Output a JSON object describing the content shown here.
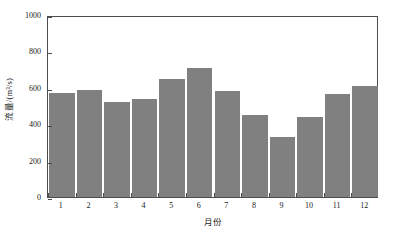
{
  "chart_data": {
    "type": "bar",
    "title": "",
    "subtitle": "",
    "xlabel": "月份",
    "ylabel": "流量/(m³/s)",
    "categories": [
      "1",
      "2",
      "3",
      "4",
      "5",
      "6",
      "7",
      "8",
      "9",
      "10",
      "11",
      "12"
    ],
    "values": [
      573,
      590,
      520,
      540,
      648,
      710,
      585,
      448,
      328,
      440,
      565,
      608
    ],
    "series": [
      {
        "name": "流量",
        "values": [
          573,
          590,
          520,
          540,
          648,
          710,
          585,
          448,
          328,
          440,
          565,
          608
        ]
      }
    ],
    "ylim": [
      0,
      1000
    ],
    "ytick_labels": [
      "0",
      "200",
      "400",
      "600",
      "800",
      "1000"
    ],
    "ytick_values": [
      0,
      200,
      400,
      600,
      800,
      1000
    ],
    "xtick_labels": [
      "1",
      "2",
      "3",
      "4",
      "5",
      "6",
      "7",
      "8",
      "9",
      "10",
      "11",
      "12"
    ],
    "grid": false,
    "legend": false,
    "legend_position": "none",
    "bar_color": "#808080",
    "bar_edge_color": "#ffffff",
    "axis_color": "#4d4d4d",
    "background_color": "#ffffff"
  }
}
